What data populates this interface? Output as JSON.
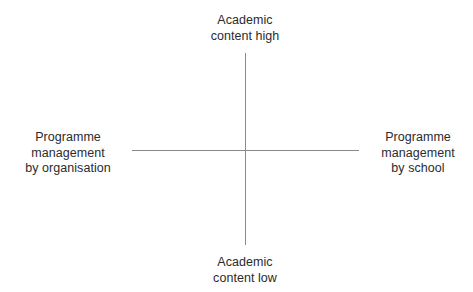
{
  "diagram": {
    "type": "2x2-quadrant-matrix",
    "background_color": "#ffffff",
    "axis_color": "#8a8a8a",
    "text_color": "#2b2b2b",
    "axes": {
      "vertical": {
        "top_label": "Academic\ncontent high",
        "bottom_label": "Academic\ncontent low"
      },
      "horizontal": {
        "left_label": "Programme\nmanagement\nby organisation",
        "right_label": "Programme\nmanagement\nby school"
      }
    }
  },
  "chart_data": {
    "type": "scatter",
    "title": "",
    "xlabel": "",
    "ylabel": "",
    "grid": false,
    "legend": "none",
    "axis_style": "crosshair-quadrant",
    "x_axis": {
      "negative_end_label": "Programme management by organisation",
      "positive_end_label": "Programme management by school"
    },
    "y_axis": {
      "positive_end_label": "Academic content high",
      "negative_end_label": "Academic content low"
    },
    "series": [],
    "annotations": []
  }
}
